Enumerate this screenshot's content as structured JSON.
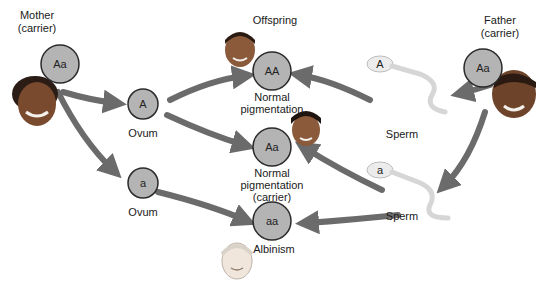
{
  "colors": {
    "circle_fill": "#b4b4b4",
    "circle_stroke": "#2a2a2a",
    "arrow": "#6b6b6b",
    "sperm": "#e9e9e9"
  },
  "parents": {
    "mother": {
      "label": "Mother",
      "sublabel": "(carrier)",
      "genotype": "Aa"
    },
    "father": {
      "label": "Father",
      "sublabel": "(carrier)",
      "genotype": "Aa"
    }
  },
  "gametes": {
    "ovum_A": {
      "allele": "A",
      "label": "Ovum"
    },
    "ovum_a": {
      "allele": "a",
      "label": "Ovum"
    },
    "sperm_A": {
      "allele": "A",
      "label": "Sperm"
    },
    "sperm_a": {
      "allele": "a",
      "label": "Sperm"
    }
  },
  "offspring": {
    "heading": "Offspring",
    "AA": {
      "genotype": "AA",
      "line1": "Normal",
      "line2": "pigmentation"
    },
    "Aa": {
      "genotype": "Aa",
      "line1": "Normal",
      "line2": "pigmentation",
      "line3": "(carrier)"
    },
    "aa": {
      "genotype": "aa",
      "line1": "Albinism"
    }
  },
  "icons": [
    "mother-face-icon",
    "father-face-icon",
    "child-face-icon",
    "sperm-icon"
  ]
}
